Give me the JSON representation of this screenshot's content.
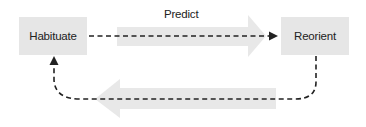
{
  "diagram": {
    "nodes": [
      {
        "id": "habituate",
        "label": "Habituate"
      },
      {
        "id": "reorient",
        "label": "Reorient"
      }
    ],
    "edges": [
      {
        "from": "habituate",
        "to": "reorient",
        "label": "Predict",
        "style": "dashed",
        "direction": "right"
      },
      {
        "from": "reorient",
        "to": "habituate",
        "label": "",
        "style": "dashed",
        "direction": "left"
      }
    ],
    "colors": {
      "node_fill": "#e6e6e6",
      "big_arrow_fill": "#e8e8e8",
      "line": "#222222"
    }
  }
}
